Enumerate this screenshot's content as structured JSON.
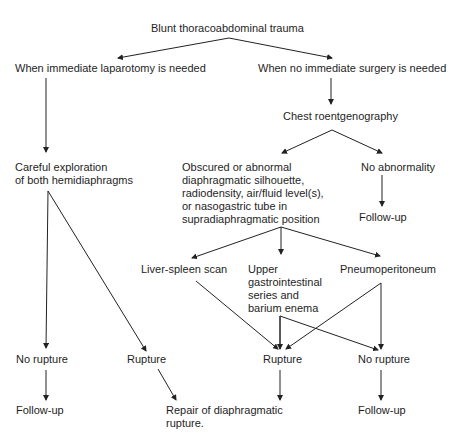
{
  "diagram": {
    "type": "flowchart",
    "title": "Blunt thoracoabdominal trauma",
    "nodes": {
      "root": "Blunt thoracoabdominal trauma",
      "laparotomy": "When immediate laparotomy is needed",
      "no_surgery": "When no immediate surgery is needed",
      "chest": "Chest roentgenography",
      "explore": "Careful exploration\nof both hemidiaphragms",
      "abnormal": "Obscured or abnormal\ndiaphragmatic silhouette,\nradiodensity, air/fluid level(s),\nor nasogastric tube in\nsupradiaphragmatic position",
      "no_abnormality": "No abnormality",
      "followup_right_top": "Follow-up",
      "liver_spleen": "Liver-spleen scan",
      "upper_gi": "Upper\ngastrointestinal\nseries and\nbarium enema",
      "pneumo": "Pneumoperitoneum",
      "no_rupture_left": "No rupture",
      "rupture_left": "Rupture",
      "rupture_mid": "Rupture",
      "no_rupture_right": "No rupture",
      "followup_left": "Follow-up",
      "repair": "Repair of diaphragmatic\nrupture.",
      "followup_right": "Follow-up"
    },
    "edges": [
      [
        "root",
        "laparotomy"
      ],
      [
        "root",
        "no_surgery"
      ],
      [
        "laparotomy",
        "explore"
      ],
      [
        "no_surgery",
        "chest"
      ],
      [
        "chest",
        "abnormal"
      ],
      [
        "chest",
        "no_abnormality"
      ],
      [
        "no_abnormality",
        "followup_right_top"
      ],
      [
        "explore",
        "no_rupture_left"
      ],
      [
        "explore",
        "rupture_left"
      ],
      [
        "abnormal",
        "liver_spleen"
      ],
      [
        "abnormal",
        "upper_gi"
      ],
      [
        "abnormal",
        "pneumo"
      ],
      [
        "liver_spleen",
        "rupture_mid"
      ],
      [
        "upper_gi",
        "rupture_mid"
      ],
      [
        "upper_gi",
        "no_rupture_right"
      ],
      [
        "pneumo",
        "rupture_mid"
      ],
      [
        "pneumo",
        "no_rupture_right"
      ],
      [
        "no_rupture_left",
        "followup_left"
      ],
      [
        "rupture_left",
        "repair"
      ],
      [
        "rupture_mid",
        "repair"
      ],
      [
        "no_rupture_right",
        "followup_right"
      ]
    ],
    "line_color": "#222222"
  }
}
